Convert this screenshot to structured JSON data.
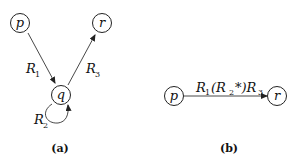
{
  "diagram_a": {
    "caption": "(a)",
    "nodes": [
      {
        "id": "p",
        "label": "p"
      },
      {
        "id": "q",
        "label": "q"
      },
      {
        "id": "r",
        "label": "r"
      }
    ],
    "edges": [
      {
        "from": "p",
        "to": "q",
        "label": "R",
        "sub": "1"
      },
      {
        "from": "q",
        "to": "q",
        "label": "R",
        "sub": "2"
      },
      {
        "from": "q",
        "to": "r",
        "label": "R",
        "sub": "3"
      }
    ]
  },
  "diagram_b": {
    "caption": "(b)",
    "nodes": [
      {
        "id": "p",
        "label": "p"
      },
      {
        "id": "r",
        "label": "r"
      }
    ],
    "edge": {
      "from": "p",
      "to": "r",
      "label_parts": [
        "R",
        "1",
        "(R",
        "2",
        "*)R",
        "3"
      ]
    }
  }
}
